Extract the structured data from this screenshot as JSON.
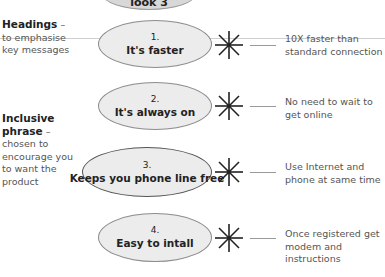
{
  "banner": {
    "label": "look 3"
  },
  "annotations": [
    {
      "heading": "Headings",
      "dash": " –",
      "lines": [
        "to emphasise",
        "key messages"
      ]
    },
    {
      "heading": "Inclusive",
      "heading2": "phrase",
      "dash": " –",
      "lines": [
        "chosen to",
        "encourage you",
        "to want the",
        "product"
      ]
    }
  ],
  "benefits": [
    {
      "number": "1.",
      "title": "It's faster",
      "description": "10X faster than standard connection"
    },
    {
      "number": "2.",
      "title": "It's always on",
      "description": "No need to wait to get online"
    },
    {
      "number": "3.",
      "title": "Keeps you phone line free",
      "description": "Use Internet and phone at same time"
    },
    {
      "number": "4.",
      "title": "Easy to intall",
      "description": "Once registered get modem and instructions"
    }
  ],
  "colors": {
    "ellipse_fill": "#ececec",
    "ellipse_border": "#8c8c8c",
    "text": "#222222",
    "note_text": "#555555"
  }
}
